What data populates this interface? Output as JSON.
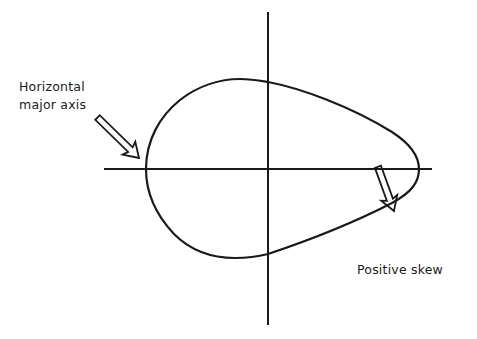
{
  "diagram": {
    "colors": {
      "ink": "#1a1a1a",
      "background": "#ffffff"
    },
    "labels": {
      "major_axis": [
        "Horizontal",
        "major axis"
      ],
      "skew": "Positive skew"
    },
    "axes": {
      "horizontal": {
        "x1": 104,
        "y1": 169,
        "x2": 432,
        "y2": 169
      },
      "vertical": {
        "x1": 268,
        "y1": 12,
        "x2": 268,
        "y2": 325
      }
    },
    "shape": {
      "type": "teardrop",
      "leftmost_x": 146,
      "rightmost_x": 419,
      "top_y": 79,
      "bottom_y": 258
    },
    "arrows": [
      {
        "name": "major-axis-arrow",
        "tail": [
          97,
          117
        ],
        "tip": [
          139,
          158
        ]
      },
      {
        "name": "skew-arrow",
        "tail": [
          410,
          255
        ],
        "tip": [
          394,
          211
        ]
      }
    ]
  }
}
